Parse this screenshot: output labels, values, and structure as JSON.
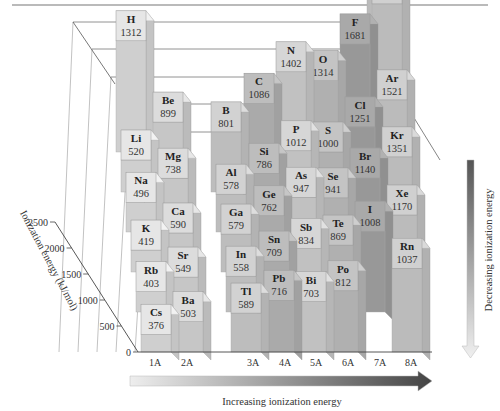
{
  "chart_data": {
    "type": "bar3d",
    "title": "",
    "zlabel": "Ionization energy (kJ/mol)",
    "zlim": [
      0,
      2500
    ],
    "zticks": [
      0,
      500,
      1000,
      1500,
      2000,
      2500
    ],
    "groups": [
      "1A",
      "2A",
      "3A",
      "4A",
      "5A",
      "6A",
      "7A",
      "8A"
    ],
    "horizontal_arrow_label": "Increasing ionization energy",
    "vertical_arrow_label": "Decreasing ionization energy",
    "elements": [
      {
        "symbol": "H",
        "value": 1312,
        "group": "1A",
        "period": 1
      },
      {
        "symbol": "He",
        "value": 2372,
        "group": "8A",
        "period": 1
      },
      {
        "symbol": "Li",
        "value": 520,
        "group": "1A",
        "period": 2
      },
      {
        "symbol": "Be",
        "value": 899,
        "group": "2A",
        "period": 2
      },
      {
        "symbol": "B",
        "value": 801,
        "group": "3A",
        "period": 2
      },
      {
        "symbol": "C",
        "value": 1086,
        "group": "4A",
        "period": 2
      },
      {
        "symbol": "N",
        "value": 1402,
        "group": "5A",
        "period": 2
      },
      {
        "symbol": "O",
        "value": 1314,
        "group": "6A",
        "period": 2
      },
      {
        "symbol": "F",
        "value": 1681,
        "group": "7A",
        "period": 2
      },
      {
        "symbol": "Ne",
        "value": 2081,
        "group": "8A",
        "period": 2
      },
      {
        "symbol": "Na",
        "value": 496,
        "group": "1A",
        "period": 3
      },
      {
        "symbol": "Mg",
        "value": 738,
        "group": "2A",
        "period": 3
      },
      {
        "symbol": "Al",
        "value": 578,
        "group": "3A",
        "period": 3
      },
      {
        "symbol": "Si",
        "value": 786,
        "group": "4A",
        "period": 3
      },
      {
        "symbol": "P",
        "value": 1012,
        "group": "5A",
        "period": 3
      },
      {
        "symbol": "S",
        "value": 1000,
        "group": "6A",
        "period": 3
      },
      {
        "symbol": "Cl",
        "value": 1251,
        "group": "7A",
        "period": 3
      },
      {
        "symbol": "Ar",
        "value": 1521,
        "group": "8A",
        "period": 3
      },
      {
        "symbol": "K",
        "value": 419,
        "group": "1A",
        "period": 4
      },
      {
        "symbol": "Ca",
        "value": 590,
        "group": "2A",
        "period": 4
      },
      {
        "symbol": "Ga",
        "value": 579,
        "group": "3A",
        "period": 4
      },
      {
        "symbol": "Ge",
        "value": 762,
        "group": "4A",
        "period": 4
      },
      {
        "symbol": "As",
        "value": 947,
        "group": "5A",
        "period": 4
      },
      {
        "symbol": "Se",
        "value": 941,
        "group": "6A",
        "period": 4
      },
      {
        "symbol": "Br",
        "value": 1140,
        "group": "7A",
        "period": 4
      },
      {
        "symbol": "Kr",
        "value": 1351,
        "group": "8A",
        "period": 4
      },
      {
        "symbol": "Rb",
        "value": 403,
        "group": "1A",
        "period": 5
      },
      {
        "symbol": "Sr",
        "value": 549,
        "group": "2A",
        "period": 5
      },
      {
        "symbol": "In",
        "value": 558,
        "group": "3A",
        "period": 5
      },
      {
        "symbol": "Sn",
        "value": 709,
        "group": "4A",
        "period": 5
      },
      {
        "symbol": "Sb",
        "value": 834,
        "group": "5A",
        "period": 5
      },
      {
        "symbol": "Te",
        "value": 869,
        "group": "6A",
        "period": 5
      },
      {
        "symbol": "I",
        "value": 1008,
        "group": "7A",
        "period": 5
      },
      {
        "symbol": "Xe",
        "value": 1170,
        "group": "8A",
        "period": 5
      },
      {
        "symbol": "Cs",
        "value": 376,
        "group": "1A",
        "period": 6
      },
      {
        "symbol": "Ba",
        "value": 503,
        "group": "2A",
        "period": 6
      },
      {
        "symbol": "Tl",
        "value": 589,
        "group": "3A",
        "period": 6
      },
      {
        "symbol": "Pb",
        "value": 716,
        "group": "4A",
        "period": 6
      },
      {
        "symbol": "Bi",
        "value": 703,
        "group": "5A",
        "period": 6
      },
      {
        "symbol": "Po",
        "value": 812,
        "group": "6A",
        "period": 6
      },
      {
        "symbol": "Rn",
        "value": 1037,
        "group": "8A",
        "period": 6
      }
    ],
    "group_colors": {
      "1A": "#e6e6e6",
      "2A": "#dcdcdc",
      "3A": "#d2d2d2",
      "4A": "#bdbdbd",
      "5A": "#d6d6d6",
      "6A": "#c4c4c4",
      "7A": "#a9a9a9",
      "8A": "#d0d0d0"
    }
  }
}
